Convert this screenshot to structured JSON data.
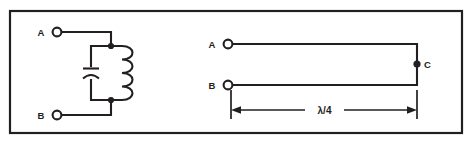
{
  "figure": {
    "background_color": "#ffffff",
    "ink_color": "#231f20",
    "frame": {
      "name": "figure-border",
      "x": 10,
      "y": 11,
      "width": 452,
      "height": 122
    }
  },
  "left_circuit": {
    "name": "parallel-lc-tank-circuit",
    "terminals": [
      {
        "id": "A",
        "label": "A",
        "type": "open-circle",
        "cx": 57,
        "cy": 32
      },
      {
        "id": "B",
        "label": "B",
        "type": "open-circle",
        "cx": 57,
        "cy": 115
      }
    ],
    "components": [
      {
        "id": "C1",
        "type": "capacitor",
        "orientation": "vertical"
      },
      {
        "id": "L1",
        "type": "inductor",
        "orientation": "vertical",
        "turns": 4
      }
    ],
    "junctions": [
      {
        "id": "top-node",
        "cx": 111,
        "cy": 46
      },
      {
        "id": "bottom-node",
        "cx": 111,
        "cy": 100
      }
    ]
  },
  "right_circuit": {
    "name": "quarter-wave-transmission-line",
    "terminals": [
      {
        "id": "A",
        "label": "A",
        "type": "open-circle",
        "cx": 228,
        "cy": 44
      },
      {
        "id": "B",
        "label": "B",
        "type": "open-circle",
        "cx": 228,
        "cy": 85
      },
      {
        "id": "C",
        "label": "C",
        "type": "filled-dot",
        "cx": 417,
        "cy": 64
      }
    ],
    "dimension": {
      "name": "quarter-wavelength-dimension",
      "label": "λ/4",
      "style": "double-arrow",
      "from_x": 231,
      "to_x": 417,
      "y": 110
    }
  }
}
